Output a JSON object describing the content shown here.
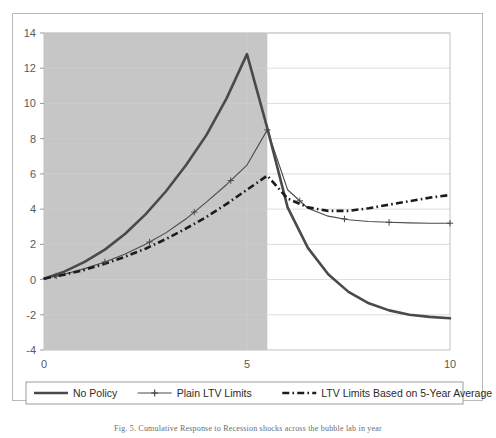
{
  "figure": {
    "caption": "Fig. 5. Cumulative Response to Recession shocks across the bubble lab in year",
    "background_color": "#ffffff",
    "frame_color": "#b9b9b9"
  },
  "chart_data": {
    "type": "line",
    "title": "",
    "xlabel": "",
    "ylabel": "",
    "xlim": [
      0,
      10
    ],
    "ylim": [
      -4,
      14
    ],
    "xticks": [
      0,
      5,
      10
    ],
    "xtick_labels": [
      "0",
      "5",
      "10"
    ],
    "yticks": [
      -4,
      -2,
      0,
      2,
      4,
      6,
      8,
      10,
      12,
      14
    ],
    "ytick_labels": [
      "-4",
      "-2",
      "0",
      "2",
      "4",
      "6",
      "8",
      "10",
      "12",
      "14"
    ],
    "grid": true,
    "grid_color": "#cfcfcf",
    "plot_bgcolor": "#ffffff",
    "shaded_region": {
      "x_start": 0,
      "x_end": 5.5,
      "color": "#c6c6c6",
      "label": "bubble period"
    },
    "legend_position": "below-axes",
    "series": [
      {
        "name": "No Policy",
        "style": "thick-solid",
        "color": "#4a4a4a",
        "width": 2.6,
        "marker": "none",
        "x": [
          0,
          0.5,
          1,
          1.5,
          2,
          2.5,
          3,
          3.5,
          4,
          4.5,
          5,
          5.5,
          6,
          6.5,
          7,
          7.5,
          8,
          8.5,
          9,
          9.5,
          10
        ],
        "y": [
          0.05,
          0.45,
          1.0,
          1.7,
          2.6,
          3.7,
          5.0,
          6.5,
          8.2,
          10.3,
          12.8,
          8.6,
          4.1,
          1.8,
          0.3,
          -0.7,
          -1.35,
          -1.75,
          -2.0,
          -2.12,
          -2.2
        ]
      },
      {
        "name": "Plain LTV Limits",
        "style": "thin-solid-plus",
        "color": "#4a4a4a",
        "width": 1.1,
        "marker": "plus",
        "x": [
          0,
          0.5,
          1,
          1.5,
          2,
          2.5,
          3,
          3.5,
          4,
          4.5,
          5,
          5.5,
          6,
          6.5,
          7,
          7.5,
          8,
          8.5,
          9,
          9.5,
          10
        ],
        "y": [
          0.05,
          0.3,
          0.62,
          1.0,
          1.45,
          2.0,
          2.65,
          3.45,
          4.4,
          5.4,
          6.5,
          8.5,
          5.1,
          4.05,
          3.6,
          3.4,
          3.3,
          3.25,
          3.22,
          3.2,
          3.2
        ]
      },
      {
        "name": "LTV Limits Based on 5-Year Average",
        "style": "thick-dashdot",
        "color": "#1c1c1c",
        "width": 2.6,
        "marker": "none",
        "x": [
          0,
          0.5,
          1,
          1.5,
          2,
          2.5,
          3,
          3.5,
          4,
          4.5,
          5,
          5.5,
          6,
          6.5,
          7,
          7.5,
          8,
          8.5,
          9,
          9.5,
          10
        ],
        "y": [
          0.05,
          0.28,
          0.55,
          0.9,
          1.3,
          1.75,
          2.3,
          2.9,
          3.55,
          4.3,
          5.1,
          5.9,
          4.6,
          4.1,
          3.9,
          3.9,
          4.05,
          4.25,
          4.45,
          4.65,
          4.8
        ]
      }
    ],
    "markers_plain_ltv": {
      "x": [
        0.3,
        1.5,
        2.6,
        3.7,
        4.6,
        5.5,
        6.3,
        7.4,
        8.5,
        10.0
      ],
      "note": "plus markers along Plain LTV Limits line"
    },
    "legend_entries": [
      {
        "label": "No Policy",
        "style": "thick-solid"
      },
      {
        "label": "Plain LTV Limits",
        "style": "thin-solid-plus"
      },
      {
        "label": "LTV Limits Based on 5-Year Average",
        "style": "thick-dashdot"
      }
    ]
  }
}
